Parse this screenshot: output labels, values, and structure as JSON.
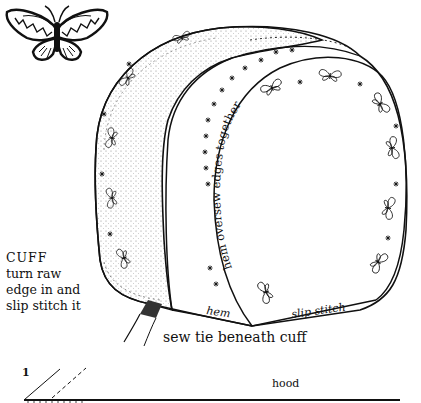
{
  "diagram": {
    "colors": {
      "ink": "#111111",
      "paper": "#ffffff",
      "stipple": "#9a9a9a"
    }
  },
  "labels": {
    "cuff": {
      "title": "CUFF",
      "lines": [
        "turn raw",
        "edge in and",
        "slip stitch it"
      ]
    },
    "hem_bottom": "hem",
    "slip_stitch": "slip stitch",
    "sew_tie": "sew tie beneath cuff",
    "curved_instruction": "hem oversew edges together",
    "step_number": "1",
    "pattern_piece": "hood"
  },
  "decorations": {
    "butterfly_logo": "butterfly-icon",
    "embroidery_motifs": [
      "butterfly-motif",
      "star-stitch"
    ]
  }
}
